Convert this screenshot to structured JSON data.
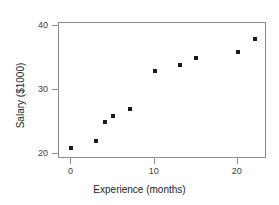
{
  "chart_data": {
    "type": "scatter",
    "title": "",
    "xlabel": "Experience (months)",
    "ylabel": "Salary ($1000)",
    "xlim": [
      -1.5,
      23.5
    ],
    "ylim": [
      19.2,
      40.5
    ],
    "xticks": [
      0,
      10,
      20
    ],
    "yticks": [
      20,
      30,
      40
    ],
    "xticklabels": [
      "0",
      "10",
      "20"
    ],
    "yticklabels": [
      "20",
      "30",
      "40"
    ],
    "grid": false,
    "legend": null,
    "marker": "square",
    "marker_color": "#1a1a1a",
    "frame_color": "#8c8c8c",
    "x": [
      0,
      3,
      4,
      5,
      7,
      10,
      13,
      15,
      20,
      22
    ],
    "y": [
      21,
      22,
      25,
      26,
      27,
      33,
      34,
      35,
      36,
      38
    ],
    "points": [
      {
        "x": 0,
        "y": 21
      },
      {
        "x": 3,
        "y": 22
      },
      {
        "x": 4,
        "y": 25
      },
      {
        "x": 5,
        "y": 26
      },
      {
        "x": 7,
        "y": 27
      },
      {
        "x": 10,
        "y": 33
      },
      {
        "x": 13,
        "y": 34
      },
      {
        "x": 15,
        "y": 35
      },
      {
        "x": 20,
        "y": 36
      },
      {
        "x": 22,
        "y": 38
      }
    ]
  }
}
